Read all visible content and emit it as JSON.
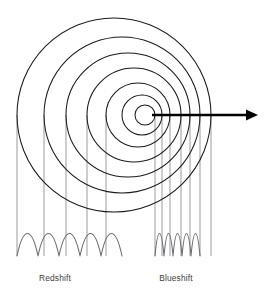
{
  "figure": {
    "background_color": "#ffffff",
    "width": 272,
    "height": 303
  },
  "labels": {
    "redshift": "Redshift",
    "blueshift": "Blueshift",
    "redshift_x": 55,
    "redshift_y": 281,
    "blueshift_x": 176,
    "blueshift_y": 281,
    "color": "#3d3d40",
    "font_size": 8.4
  },
  "chart_data": {
    "type": "diagram",
    "center_line_y": 115,
    "wavefront_color": "#1a1a1a",
    "wavefronts": [
      {
        "index": 1,
        "cx": 114,
        "cy": 115,
        "r": 97,
        "left_x": 17,
        "right_x": 211
      },
      {
        "index": 2,
        "cx": 122,
        "cy": 115,
        "r": 78,
        "left_x": 44,
        "right_x": 200
      },
      {
        "index": 3,
        "cx": 128,
        "cy": 115,
        "r": 62,
        "left_x": 66,
        "right_x": 190
      },
      {
        "index": 4,
        "cx": 134,
        "cy": 115,
        "r": 47,
        "left_x": 87,
        "right_x": 181
      },
      {
        "index": 5,
        "cx": 138,
        "cy": 115,
        "r": 32,
        "left_x": 106,
        "right_x": 170
      },
      {
        "index": 6,
        "cx": 142,
        "cy": 115,
        "r": 20,
        "left_x": 122,
        "right_x": 162
      },
      {
        "index": 7,
        "cx": 145,
        "cy": 115,
        "r": 10,
        "left_x": 135,
        "right_x": 155
      }
    ],
    "drop_lines": {
      "color": "#8a8a8a",
      "bottom_y": 256,
      "redshift_x_positions": [
        17,
        44,
        66,
        87,
        106
      ],
      "blueshift_x_positions": [
        155,
        162,
        170,
        181,
        190,
        200,
        211
      ]
    },
    "arrow": {
      "label": "motion direction",
      "x1": 152,
      "y1": 115,
      "x2": 258,
      "y2": 115,
      "color": "#000000",
      "head_length": 12,
      "head_width": 11
    },
    "waves": [
      {
        "name": "Redshift",
        "side": "left",
        "start_x": 17,
        "end_x": 122,
        "wavelength": 21,
        "lobes": 5,
        "baseline_y": 256,
        "amplitude": 30,
        "color": "#6e6e72"
      },
      {
        "name": "Blueshift",
        "side": "right",
        "start_x": 155,
        "end_x": 200,
        "wavelength": 9,
        "lobes": 5,
        "baseline_y": 256,
        "amplitude": 30,
        "color": "#6e6e72"
      }
    ],
    "annotations": [
      {
        "text": "Redshift",
        "x": 55,
        "y": 281
      },
      {
        "text": "Blueshift",
        "x": 176,
        "y": 281
      }
    ]
  }
}
